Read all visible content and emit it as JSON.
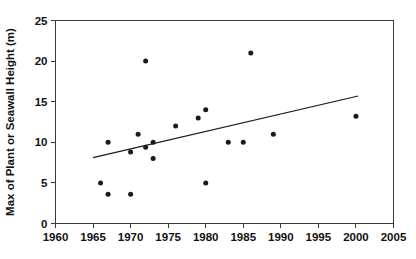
{
  "chart_data": {
    "type": "scatter",
    "title": "",
    "xlabel": "",
    "ylabel": "Max of Plant or Seawall Height (m)",
    "xlim": [
      1960,
      2005
    ],
    "ylim": [
      0,
      25
    ],
    "xticks": [
      1960,
      1965,
      1970,
      1975,
      1980,
      1985,
      1990,
      1995,
      2000,
      2005
    ],
    "yticks": [
      0,
      5,
      10,
      15,
      20,
      25
    ],
    "xtick_labels": [
      "1960",
      "1965",
      "1970",
      "1975",
      "1980",
      "1985",
      "1990",
      "1995",
      "2000",
      "2005"
    ],
    "ytick_labels": [
      "0",
      "5",
      "10",
      "15",
      "20",
      "25"
    ],
    "grid": false,
    "legend": false,
    "legend_position": "none",
    "marker": "filled-circle",
    "marker_color": "#1a1a1a",
    "points": [
      {
        "x": 1966,
        "y": 5.0
      },
      {
        "x": 1967,
        "y": 10.0
      },
      {
        "x": 1967,
        "y": 3.6
      },
      {
        "x": 1970,
        "y": 8.8
      },
      {
        "x": 1970,
        "y": 3.6
      },
      {
        "x": 1971,
        "y": 11.0
      },
      {
        "x": 1972,
        "y": 20.0
      },
      {
        "x": 1972,
        "y": 9.4
      },
      {
        "x": 1973,
        "y": 10.0
      },
      {
        "x": 1973,
        "y": 8.0
      },
      {
        "x": 1976,
        "y": 12.0
      },
      {
        "x": 1979,
        "y": 13.0
      },
      {
        "x": 1980,
        "y": 14.0
      },
      {
        "x": 1980,
        "y": 5.0
      },
      {
        "x": 1983,
        "y": 10.0
      },
      {
        "x": 1985,
        "y": 10.0
      },
      {
        "x": 1986,
        "y": 21.0
      },
      {
        "x": 1989,
        "y": 11.0
      },
      {
        "x": 2000,
        "y": 13.2
      }
    ],
    "trendline": {
      "type": "linear",
      "x_start": 1965.0,
      "y_start": 8.1,
      "x_end": 2000.3,
      "y_end": 15.7
    }
  }
}
